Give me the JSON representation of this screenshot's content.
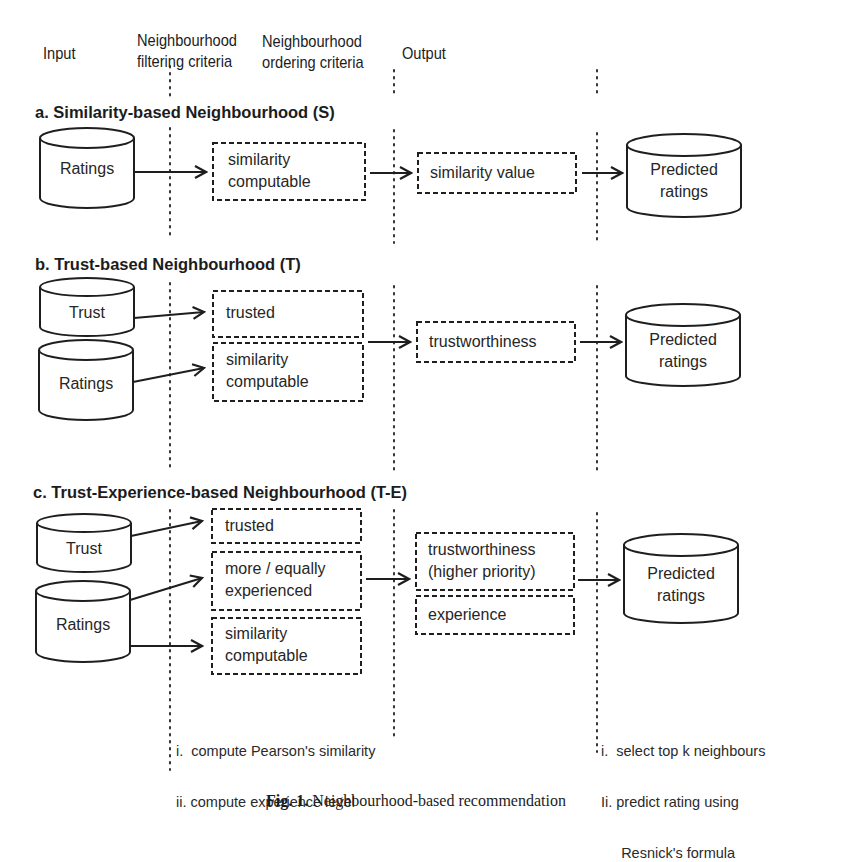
{
  "columns": {
    "input": "Input",
    "filtering": [
      "Neighbourhood",
      "filtering criteria"
    ],
    "ordering": [
      "Neighbourhood",
      "ordering criteria"
    ],
    "output": "Output"
  },
  "sections": [
    {
      "id": "a",
      "title": "a. Similarity-based Neighbourhood (S)",
      "inputs": [
        "Ratings"
      ],
      "filters": [
        [
          "similarity",
          "computable"
        ]
      ],
      "ordering": [
        [
          "similarity value"
        ]
      ],
      "output": [
        "Predicted",
        "ratings"
      ]
    },
    {
      "id": "b",
      "title": "b. Trust-based Neighbourhood (T)",
      "inputs": [
        "Trust",
        "Ratings"
      ],
      "filters": [
        [
          "trusted"
        ],
        [
          "similarity",
          "computable"
        ]
      ],
      "ordering": [
        [
          "trustworthiness"
        ]
      ],
      "output": [
        "Predicted",
        "ratings"
      ]
    },
    {
      "id": "c",
      "title": "c. Trust-Experience-based Neighbourhood (T-E)",
      "inputs": [
        "Trust",
        "Ratings"
      ],
      "filters": [
        [
          "trusted"
        ],
        [
          "more / equally",
          "experienced"
        ],
        [
          "similarity",
          "computable"
        ]
      ],
      "ordering": [
        [
          "trustworthiness",
          "(higher priority)"
        ],
        [
          "experience"
        ]
      ],
      "output": [
        "Predicted",
        "ratings"
      ]
    }
  ],
  "notes": {
    "filtering": [
      "i.  compute Pearson's similarity",
      "ii. compute experience level"
    ],
    "output": [
      "i.  select top k neighbours",
      "Ii. predict rating using",
      "     Resnick's formula"
    ]
  },
  "caption": {
    "label": "Fig. 1.",
    "text": "Neighbourhood-based recommendation"
  },
  "colors": {
    "line": "#1e1e1e",
    "text": "#1c1c1c",
    "background": "#ffffff"
  }
}
